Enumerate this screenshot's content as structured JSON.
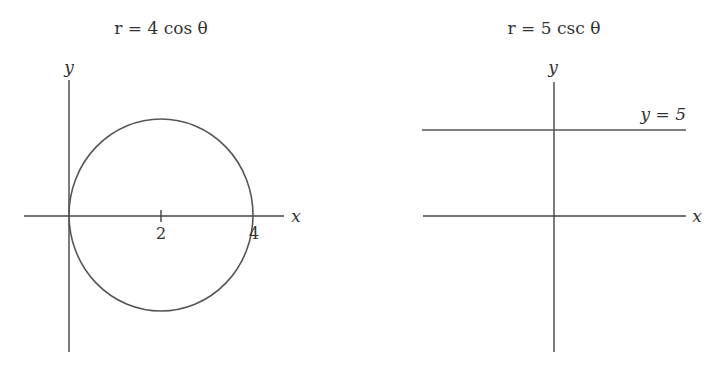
{
  "left_panel": {
    "title": "r = 4 cos θ",
    "x_axis_label": "x",
    "y_axis_label": "y",
    "tick_labels": [
      "2",
      "4"
    ],
    "curve": "circle centered at (2,0) radius 2"
  },
  "right_panel": {
    "title": "r = 5 csc θ",
    "x_axis_label": "x",
    "y_axis_label": "y",
    "line_label": "y = 5",
    "curve": "horizontal line y = 5"
  },
  "colors": {
    "stroke": "#444444",
    "background": "#ffffff"
  }
}
